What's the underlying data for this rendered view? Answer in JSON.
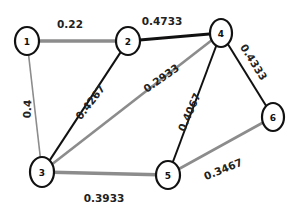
{
  "diagram": {
    "type": "weighted-undirected-graph",
    "colors": {
      "dark_edge": "#111111",
      "light_edge": "#8c8c8c",
      "node_stroke": "#111111",
      "node_fill": "#ffffff"
    },
    "nodes": [
      {
        "id": "1",
        "label": "1",
        "x": 27,
        "y": 41,
        "rx": 12,
        "ry": 14
      },
      {
        "id": "2",
        "label": "2",
        "x": 128,
        "y": 41,
        "rx": 12,
        "ry": 14
      },
      {
        "id": "4",
        "label": "4",
        "x": 221,
        "y": 33,
        "rx": 11,
        "ry": 14
      },
      {
        "id": "6",
        "label": "6",
        "x": 273,
        "y": 117,
        "rx": 11,
        "ry": 14
      },
      {
        "id": "3",
        "label": "3",
        "x": 42,
        "y": 172,
        "rx": 12,
        "ry": 15
      },
      {
        "id": "5",
        "label": "5",
        "x": 168,
        "y": 175,
        "rx": 12,
        "ry": 14
      }
    ],
    "edges": [
      {
        "from": "1",
        "to": "2",
        "weight": "0.22",
        "style": "light",
        "width": 3.5,
        "label_x": 70,
        "label_y": 24,
        "label_rot": 0
      },
      {
        "from": "2",
        "to": "4",
        "weight": "0.4733",
        "style": "dark",
        "width": 2.8,
        "label_x": 162,
        "label_y": 21,
        "label_rot": 0
      },
      {
        "from": "1",
        "to": "3",
        "weight": "0.4",
        "style": "light",
        "width": 1.6,
        "label_x": 27,
        "label_y": 109,
        "label_rot": -87
      },
      {
        "from": "2",
        "to": "3",
        "weight": "0.4267",
        "style": "dark",
        "width": 2.2,
        "label_x": 90,
        "label_y": 102,
        "label_rot": -52
      },
      {
        "from": "3",
        "to": "4",
        "weight": "0.2933",
        "style": "light",
        "width": 2.6,
        "label_x": 161,
        "label_y": 78,
        "label_rot": -35
      },
      {
        "from": "4",
        "to": "6",
        "weight": "0.4333",
        "style": "dark",
        "width": 2.0,
        "label_x": 254,
        "label_y": 62,
        "label_rot": 58
      },
      {
        "from": "4",
        "to": "5",
        "weight": "0.4067",
        "style": "dark",
        "width": 2.0,
        "label_x": 189,
        "label_y": 112,
        "label_rot": -66
      },
      {
        "from": "3",
        "to": "5",
        "weight": "0.3933",
        "style": "light",
        "width": 3.5,
        "label_x": 104,
        "label_y": 198,
        "label_rot": 0
      },
      {
        "from": "5",
        "to": "6",
        "weight": "0.3467",
        "style": "light",
        "width": 2.6,
        "label_x": 223,
        "label_y": 169,
        "label_rot": -22
      }
    ]
  }
}
